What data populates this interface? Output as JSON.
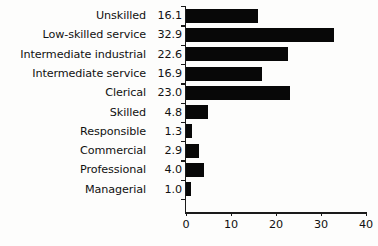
{
  "chart_data": {
    "type": "bar",
    "orientation": "horizontal",
    "title": "",
    "subtitle": "",
    "xlabel": "",
    "ylabel": "",
    "xlim": [
      0,
      40
    ],
    "xticks": [
      0,
      10,
      20,
      30,
      40
    ],
    "xtick_labels": [
      "0",
      "10",
      "20",
      "30",
      "40"
    ],
    "grid": false,
    "legend": false,
    "bar_color": "#080808",
    "background_color": "#fdfdfc",
    "axis_color": "#1a1a1a",
    "categories": [
      "Unskilled",
      "Low-skilled service",
      "Intermediate industrial",
      "Intermediate service",
      "Clerical",
      "Skilled",
      "Responsible",
      "Commercial",
      "Professional",
      "Managerial"
    ],
    "values": [
      16.1,
      32.9,
      22.6,
      16.9,
      23.0,
      4.8,
      1.3,
      2.9,
      4.0,
      1.0
    ],
    "value_labels": [
      "16.1",
      "32.9",
      "22.6",
      "16.9",
      "23.0",
      "4.8",
      "1.3",
      "2.9",
      "4.0",
      "1.0"
    ],
    "rows": [
      {
        "label": "Unskilled",
        "value": 16.1,
        "value_label": "16.1"
      },
      {
        "label": "Low-skilled service",
        "value": 32.9,
        "value_label": "32.9"
      },
      {
        "label": "Intermediate industrial",
        "value": 22.6,
        "value_label": "22.6"
      },
      {
        "label": "Intermediate service",
        "value": 16.9,
        "value_label": "16.9"
      },
      {
        "label": "Clerical",
        "value": 23.0,
        "value_label": "23.0"
      },
      {
        "label": "Skilled",
        "value": 4.8,
        "value_label": "4.8"
      },
      {
        "label": "Responsible",
        "value": 1.3,
        "value_label": "1.3"
      },
      {
        "label": "Commercial",
        "value": 2.9,
        "value_label": "2.9"
      },
      {
        "label": "Professional",
        "value": 4.0,
        "value_label": "4.0"
      },
      {
        "label": "Managerial",
        "value": 1.0,
        "value_label": "1.0"
      }
    ]
  }
}
